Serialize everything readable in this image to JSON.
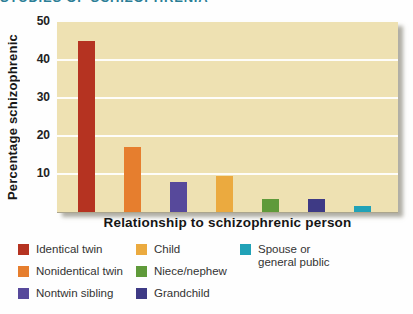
{
  "page": {
    "heading": "STUDIES OF SCHIZOPHRENIA",
    "heading_color": "#2b7e96",
    "background": "#ffffff"
  },
  "chart_data": {
    "type": "bar",
    "title": "",
    "xlabel": "Relationship to schizophrenic person",
    "ylabel": "Percentage schizophrenic",
    "ylim": [
      0,
      50
    ],
    "yticks": [
      10,
      20,
      30,
      40,
      50
    ],
    "grid": "horizontal white gridlines at 10, 20, 30, 40",
    "legend_position": "below",
    "plot_bg": "#eee1b2",
    "categories": [
      "Identical twin",
      "Nonidentical twin",
      "Nontwin sibling",
      "Child",
      "Niece/nephew",
      "Grandchild",
      "Spouse or general public"
    ],
    "values": [
      45,
      17,
      8,
      9.5,
      3.5,
      3.5,
      1.5
    ],
    "colors": [
      "#b53321",
      "#e67e2e",
      "#57499b",
      "#ebaa3f",
      "#5f9a3a",
      "#3e3a85",
      "#21a2b7"
    ]
  },
  "legend": {
    "columns": [
      {
        "items": [
          {
            "lines": [
              "Identical twin"
            ],
            "color": "#b53321"
          },
          {
            "lines": [
              "Nonidentical twin"
            ],
            "color": "#e67e2e"
          },
          {
            "lines": [
              "Nontwin sibling"
            ],
            "color": "#57499b"
          }
        ]
      },
      {
        "items": [
          {
            "lines": [
              "Child"
            ],
            "color": "#ebaa3f"
          },
          {
            "lines": [
              "Niece/nephew"
            ],
            "color": "#5f9a3a"
          },
          {
            "lines": [
              "Grandchild"
            ],
            "color": "#3e3a85"
          }
        ]
      },
      {
        "items": [
          {
            "lines": [
              "Spouse or",
              "general public"
            ],
            "color": "#21a2b7"
          }
        ]
      }
    ]
  }
}
